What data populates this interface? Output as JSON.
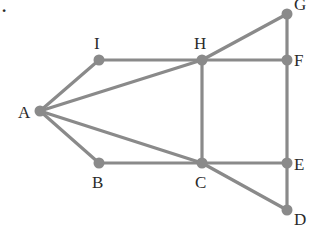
{
  "diagram": {
    "type": "graph",
    "corner_mark": ".",
    "colors": {
      "edge": "#8a8a8a",
      "vertex": "#8a8a8a",
      "label": "#2a2a2a",
      "background": "#ffffff"
    },
    "vertices": [
      {
        "id": "A",
        "label": "A",
        "x": 40,
        "y": 111,
        "lx": 18,
        "ly": 118
      },
      {
        "id": "I",
        "label": "I",
        "x": 99,
        "y": 60,
        "lx": 94,
        "ly": 49
      },
      {
        "id": "H",
        "label": "H",
        "x": 202,
        "y": 60,
        "lx": 194,
        "ly": 49
      },
      {
        "id": "G",
        "label": "G",
        "x": 287,
        "y": 14,
        "lx": 294,
        "ly": 10
      },
      {
        "id": "F",
        "label": "F",
        "x": 287,
        "y": 60,
        "lx": 294,
        "ly": 66
      },
      {
        "id": "B",
        "label": "B",
        "x": 99,
        "y": 163,
        "lx": 92,
        "ly": 188
      },
      {
        "id": "C",
        "label": "C",
        "x": 202,
        "y": 163,
        "lx": 195,
        "ly": 188
      },
      {
        "id": "E",
        "label": "E",
        "x": 287,
        "y": 163,
        "lx": 294,
        "ly": 170
      },
      {
        "id": "D",
        "label": "D",
        "x": 287,
        "y": 210,
        "lx": 294,
        "ly": 225
      }
    ],
    "edges": [
      [
        "A",
        "I"
      ],
      [
        "A",
        "H"
      ],
      [
        "A",
        "C"
      ],
      [
        "A",
        "B"
      ],
      [
        "I",
        "H"
      ],
      [
        "H",
        "F"
      ],
      [
        "H",
        "G"
      ],
      [
        "G",
        "F"
      ],
      [
        "F",
        "E"
      ],
      [
        "E",
        "D"
      ],
      [
        "H",
        "C"
      ],
      [
        "B",
        "C"
      ],
      [
        "C",
        "E"
      ],
      [
        "C",
        "D"
      ]
    ]
  }
}
